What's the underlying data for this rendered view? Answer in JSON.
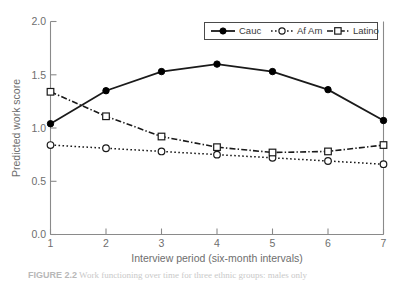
{
  "chart_data": {
    "type": "line",
    "title": "",
    "xlabel": "Interview period (six-month intervals)",
    "ylabel": "Predicted work score",
    "x": [
      1,
      2,
      3,
      4,
      5,
      6,
      7
    ],
    "xlim": [
      1,
      7
    ],
    "ylim": [
      0.0,
      2.0
    ],
    "xticks": [
      "1",
      "2",
      "3",
      "4",
      "5",
      "6",
      "7"
    ],
    "yticks": [
      "0.0",
      "0.5",
      "1.0",
      "1.5",
      "2.0"
    ],
    "ytick_values": [
      0.0,
      0.5,
      1.0,
      1.5,
      2.0
    ],
    "grid": false,
    "legend_position": "top-right-inside",
    "series": [
      {
        "name": "Cauc",
        "values": [
          1.04,
          1.35,
          1.53,
          1.6,
          1.53,
          1.36,
          1.07
        ],
        "line_style": "solid",
        "marker": "filled-circle",
        "color": "#000000"
      },
      {
        "name": "Af Am",
        "values": [
          0.84,
          0.81,
          0.78,
          0.75,
          0.72,
          0.69,
          0.66
        ],
        "line_style": "dotted",
        "marker": "open-circle",
        "color": "#1a1a1a"
      },
      {
        "name": "Latino",
        "values": [
          1.34,
          1.11,
          0.92,
          0.82,
          0.77,
          0.78,
          0.84
        ],
        "line_style": "dash-dot",
        "marker": "open-square",
        "color": "#1a1a1a"
      }
    ]
  },
  "caption": {
    "label": "FIGURE 2.2",
    "text": "Work functioning over time for three ethnic groups: males only"
  }
}
